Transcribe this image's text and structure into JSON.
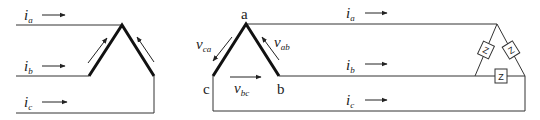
{
  "diagram": {
    "left_panel": {
      "description": "Delta winding with line currents",
      "currents": [
        {
          "symbol": "i",
          "sub": "a"
        },
        {
          "symbol": "i",
          "sub": "b"
        },
        {
          "symbol": "i",
          "sub": "c"
        }
      ]
    },
    "right_panel": {
      "description": "Delta source with phase voltages feeding balanced delta load",
      "nodes": [
        "a",
        "b",
        "c"
      ],
      "voltages": [
        {
          "symbol": "v",
          "sub": "ca"
        },
        {
          "symbol": "v",
          "sub": "ab"
        },
        {
          "symbol": "v",
          "sub": "bc"
        }
      ],
      "currents": [
        {
          "symbol": "i",
          "sub": "a"
        },
        {
          "symbol": "i",
          "sub": "b"
        },
        {
          "symbol": "i",
          "sub": "c"
        }
      ],
      "load_impedances": [
        "Z",
        "Z",
        "Z"
      ]
    },
    "colors": {
      "line": "#333333",
      "winding": "#111111"
    }
  }
}
